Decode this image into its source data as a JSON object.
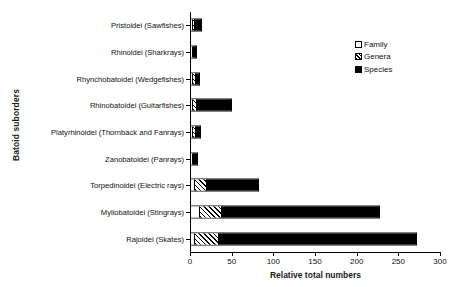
{
  "chart_data": {
    "type": "bar",
    "orientation": "horizontal",
    "stacked": true,
    "title": "",
    "xlabel": "Relative total numbers",
    "ylabel": "Batoid suborders",
    "xlim": [
      0,
      300
    ],
    "xticks": [
      0,
      50,
      100,
      150,
      200,
      250,
      300
    ],
    "grid": false,
    "legend_position": "top-right",
    "categories": [
      "Pristoidei (Sawfishes)",
      "Rhinoidei (Sharkrays)",
      "Rhynchobatoidei (Wedgefishes)",
      "Rhinobatoidei (Guitarfishes)",
      "Platyrhinoidei (Thornback and Fanrays)",
      "Zanobatoidei (Panrays)",
      "Torpedinoidei (Electric rays)",
      "Myliobatoidei (Stingrays)",
      "Rajoidei (Skates)"
    ],
    "series": [
      {
        "name": "Family",
        "fill": "white",
        "values": [
          1,
          1,
          1,
          1,
          1,
          1,
          4,
          9,
          4
        ]
      },
      {
        "name": "Genera",
        "fill": "hatched",
        "values": [
          2,
          1,
          3,
          4,
          3,
          1,
          14,
          27,
          29
        ]
      },
      {
        "name": "Species",
        "fill": "black",
        "values": [
          9,
          3,
          5,
          43,
          6,
          4,
          62,
          190,
          237
        ]
      }
    ],
    "totals": [
      12,
      5,
      9,
      48,
      10,
      6,
      80,
      226,
      270
    ]
  },
  "legend": {
    "items": [
      {
        "label": "Family"
      },
      {
        "label": "Genera"
      },
      {
        "label": "Species"
      }
    ]
  },
  "axes": {
    "x_title": "Relative total numbers",
    "y_title": "Batoid suborders",
    "x_tick_labels": [
      "0",
      "50",
      "100",
      "150",
      "200",
      "250",
      "300"
    ]
  }
}
